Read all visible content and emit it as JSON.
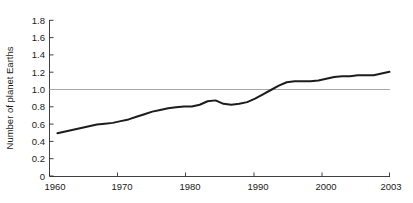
{
  "chart_data": {
    "type": "line",
    "title": "",
    "xlabel": "",
    "ylabel": "Number of planet Earths",
    "xlim": [
      1960,
      2003
    ],
    "ylim": [
      0,
      1.8
    ],
    "grid": false,
    "legend": "none",
    "x_ticks": [
      1960,
      1970,
      1980,
      1990,
      2000,
      2003
    ],
    "x_tick_labels": [
      "1960",
      "1970",
      "1980",
      "1990",
      "2000",
      "2003"
    ],
    "y_ticks": [
      0,
      0.2,
      0.4,
      0.6,
      0.8,
      1.0,
      1.2,
      1.4,
      1.6,
      1.8
    ],
    "y_tick_labels": [
      "0",
      "0.2",
      "0.4",
      "0.6",
      "0.8",
      "1.0",
      "1.2",
      "1.4",
      "1.6",
      "1.8"
    ],
    "series": [
      {
        "name": "Humanity's Ecological Footprint",
        "color": "#1c1c1c",
        "x": [
          1961,
          1962,
          1963,
          1964,
          1965,
          1966,
          1967,
          1968,
          1969,
          1970,
          1971,
          1972,
          1973,
          1974,
          1975,
          1976,
          1977,
          1978,
          1979,
          1980,
          1981,
          1982,
          1983,
          1984,
          1985,
          1986,
          1987,
          1988,
          1989,
          1990,
          1991,
          1992,
          1993,
          1994,
          1995,
          1996,
          1997,
          1998,
          1999,
          2000,
          2001,
          2002,
          2003
        ],
        "values": [
          0.5,
          0.52,
          0.54,
          0.56,
          0.58,
          0.6,
          0.61,
          0.62,
          0.64,
          0.66,
          0.69,
          0.72,
          0.75,
          0.77,
          0.79,
          0.8,
          0.81,
          0.81,
          0.83,
          0.87,
          0.88,
          0.84,
          0.83,
          0.84,
          0.86,
          0.9,
          0.95,
          1.0,
          1.05,
          1.09,
          1.1,
          1.1,
          1.1,
          1.11,
          1.13,
          1.15,
          1.16,
          1.16,
          1.17,
          1.17,
          1.17,
          1.19,
          1.21
        ]
      }
    ],
    "reference_lines": [
      {
        "name": "Earth's biocapacity",
        "orientation": "horizontal",
        "value": 1.0,
        "color": "#a8a8a8"
      }
    ]
  }
}
